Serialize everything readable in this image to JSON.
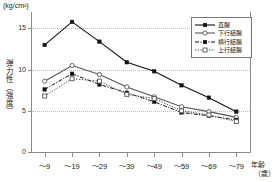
{
  "chart_data": {
    "type": "line",
    "title": "",
    "unit_label": "(kg/cm²)",
    "ylabel": "弾力性（強度）",
    "xlabel": "年齢",
    "xlabel_unit": "（歳）",
    "categories": [
      "～9",
      "～19",
      "～29",
      "～39",
      "～49",
      "～59",
      "～69",
      "～79"
    ],
    "ylim": [
      0,
      17
    ],
    "yticks": [
      0,
      5,
      10,
      15
    ],
    "grid": "horizontal-dotted",
    "legend_position": "top-right",
    "series": [
      {
        "name": "直腸",
        "marker": "filled-square",
        "line": "solid",
        "color": "#111111",
        "values": [
          13.0,
          15.8,
          13.4,
          10.9,
          9.8,
          8.1,
          6.6,
          4.9
        ]
      },
      {
        "name": "下行結腸",
        "marker": "open-circle",
        "line": "solid",
        "color": "#555555",
        "values": [
          8.6,
          10.5,
          9.4,
          7.9,
          6.7,
          5.5,
          4.9,
          4.2
        ]
      },
      {
        "name": "横行結腸",
        "marker": "filled-square",
        "line": "dash-dot",
        "color": "#111111",
        "values": [
          7.6,
          9.5,
          8.2,
          7.2,
          6.1,
          4.8,
          4.4,
          3.9
        ]
      },
      {
        "name": "上行結腸",
        "marker": "open-square",
        "line": "dotted",
        "color": "#555555",
        "values": [
          6.8,
          8.9,
          8.6,
          7.0,
          6.5,
          5.0,
          4.5,
          3.7
        ]
      }
    ]
  }
}
